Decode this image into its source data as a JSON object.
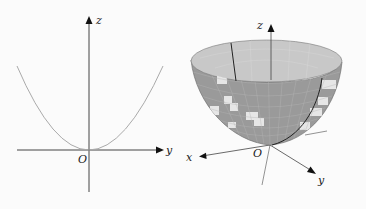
{
  "left_figure": {
    "title": "2D cross-section (parabola in yz-plane)",
    "axes": {
      "vertical_label": "z",
      "horizontal_label": "y",
      "origin_label": "O"
    },
    "curve": {
      "type": "parabola",
      "equation": "z = y^2",
      "color": "#aaaaaa"
    }
  },
  "right_figure": {
    "title": "3D paraboloid of revolution",
    "axes": {
      "z_label": "z",
      "x_label": "x",
      "y_label": "y",
      "origin_label": "O"
    },
    "surface": {
      "type": "paraboloid",
      "equation": "z = x^2 + y^2",
      "fill_color": "#9a9a9a",
      "inner_color": "#c8c8c8",
      "highlight_color": "#e6e6e6",
      "grid_color": "#bdbdbd"
    }
  }
}
